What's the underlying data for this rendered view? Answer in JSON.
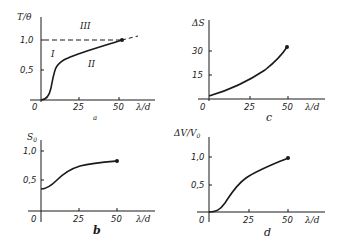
{
  "chart_data": [
    {
      "panel": "a",
      "type": "line",
      "ylabel": "T/θ",
      "xlabel": "λ/d",
      "x_ticks": [
        "0",
        "25",
        "50"
      ],
      "y_ticks": [
        "0,5",
        "1,0"
      ],
      "xlim": [
        0,
        60
      ],
      "ylim": [
        0,
        1.2
      ],
      "reference_line": {
        "y": 1.0,
        "style": "dashed"
      },
      "region_labels": [
        "I",
        "II",
        "III"
      ],
      "x": [
        0,
        3,
        6,
        9,
        12,
        15,
        20,
        25,
        30,
        35,
        40,
        45,
        50,
        52
      ],
      "values": [
        0,
        0.02,
        0.15,
        0.42,
        0.56,
        0.61,
        0.66,
        0.71,
        0.76,
        0.81,
        0.86,
        0.92,
        0.97,
        1.0
      ],
      "end_marker": {
        "x": 52,
        "y": 1.0
      }
    },
    {
      "panel": "c",
      "type": "line",
      "ylabel": "ΔS",
      "xlabel": "λ/d",
      "x_ticks": [
        "0",
        "25",
        "50"
      ],
      "y_ticks": [
        "15",
        "30"
      ],
      "xlim": [
        0,
        60
      ],
      "ylim": [
        0,
        40
      ],
      "x": [
        0,
        5,
        10,
        15,
        20,
        25,
        30,
        35,
        40,
        45,
        50
      ],
      "values": [
        2,
        4,
        6.3,
        8.8,
        11.5,
        14.3,
        17.4,
        20.7,
        24.2,
        28,
        32
      ],
      "end_marker": {
        "x": 50,
        "y": 32
      }
    },
    {
      "panel": "b",
      "type": "line",
      "ylabel": "S₀",
      "xlabel": "λ/d",
      "x_ticks": [
        "0",
        "25",
        "50"
      ],
      "y_ticks": [
        "0,5",
        "1,0"
      ],
      "xlim": [
        0,
        60
      ],
      "ylim": [
        0,
        1.2
      ],
      "x": [
        0,
        5,
        10,
        15,
        20,
        25,
        30,
        35,
        40,
        45,
        50
      ],
      "values": [
        0.35,
        0.38,
        0.48,
        0.58,
        0.65,
        0.7,
        0.73,
        0.76,
        0.78,
        0.8,
        0.82
      ],
      "end_marker": {
        "x": 50,
        "y": 0.82
      }
    },
    {
      "panel": "d",
      "type": "line",
      "ylabel": "ΔV/V₀",
      "xlabel": "λ/d",
      "x_ticks": [
        "0",
        "25",
        "50"
      ],
      "y_ticks": [
        "0,5",
        "1,0"
      ],
      "xlim": [
        0,
        60
      ],
      "ylim": [
        0,
        1.3
      ],
      "x": [
        0,
        5,
        10,
        15,
        20,
        25,
        30,
        35,
        40,
        45,
        50
      ],
      "values": [
        0,
        0.03,
        0.18,
        0.38,
        0.55,
        0.65,
        0.73,
        0.8,
        0.87,
        0.93,
        0.99
      ],
      "end_marker": {
        "x": 50,
        "y": 0.99
      }
    }
  ],
  "panels": {
    "a": {
      "ylabel": "T/θ",
      "xlabel": "λ/d",
      "caption": "a",
      "origin": "0",
      "xt1": "25",
      "xt2": "50",
      "yt1": "0,5",
      "yt2": "1,0",
      "r1": "I",
      "r2": "II",
      "r3": "III"
    },
    "c": {
      "ylabel": "ΔS",
      "xlabel": "λ/d",
      "caption": "c",
      "origin": "0",
      "xt1": "25",
      "xt2": "50",
      "yt1": "15",
      "yt2": "30"
    },
    "b": {
      "ylabel": "S",
      "ysub": "0",
      "xlabel": "λ/d",
      "caption": "b",
      "origin": "0",
      "xt1": "25",
      "xt2": "50",
      "yt1": "0,5",
      "yt2": "1,0"
    },
    "d": {
      "ylabel": "ΔV/V",
      "ysub": "0",
      "xlabel": "λ/d",
      "caption": "d",
      "origin": "0",
      "xt1": "25",
      "xt2": "50",
      "yt1": "0,5",
      "yt2": "1,0"
    }
  },
  "colors": {
    "ink": "#1a1a1a",
    "background": "#ffffff"
  }
}
